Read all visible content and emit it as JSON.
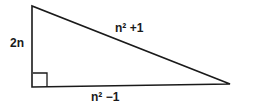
{
  "diagram": {
    "type": "right-triangle",
    "vertices": {
      "top": [
        32,
        6
      ],
      "right_angle": [
        32,
        87
      ],
      "right": [
        230,
        84
      ]
    },
    "right_angle_marker": {
      "x": 33,
      "y": 73,
      "size": 14
    },
    "labels": {
      "vertical_leg": "2n",
      "hypotenuse": "n² +1",
      "horizontal_leg": "n² −1"
    },
    "colors": {
      "stroke": "#1a1a1a",
      "background": "#ffffff"
    }
  }
}
